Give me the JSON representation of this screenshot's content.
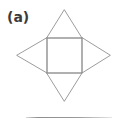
{
  "figure": {
    "part_label": "(a)",
    "caption_rule_visible": true,
    "background_color": "#ffffff",
    "stroke_color": "#8a8a8a",
    "label_color": "#3b3b3b",
    "rule_color": "#9a9a9a",
    "geometry": {
      "viewbox": "0 0 126 123",
      "square": {
        "name": "central-square",
        "x": 47,
        "y": 38,
        "width": 35,
        "height": 35,
        "corners": [
          [
            47,
            38
          ],
          [
            82,
            38
          ],
          [
            82,
            73
          ],
          [
            47,
            73
          ]
        ]
      },
      "triangles": [
        {
          "name": "top-triangle",
          "points": "47,38 82,38 64.5,10",
          "apex": [
            64.5,
            10
          ],
          "base": [
            [
              47,
              38
            ],
            [
              82,
              38
            ]
          ]
        },
        {
          "name": "right-triangle",
          "points": "82,38 82,73 110,55.5",
          "apex": [
            110,
            55.5
          ],
          "base": [
            [
              82,
              38
            ],
            [
              82,
              73
            ]
          ]
        },
        {
          "name": "bottom-triangle",
          "points": "47,73 82,73 64.5,101",
          "apex": [
            64.5,
            101
          ],
          "base": [
            [
              47,
              73
            ],
            [
              82,
              73
            ]
          ]
        },
        {
          "name": "left-triangle",
          "points": "47,38 47,73 17,55.5",
          "apex": [
            17,
            55.5
          ],
          "base": [
            [
              47,
              38
            ],
            [
              47,
              73
            ]
          ]
        }
      ],
      "rule": {
        "x1": 26,
        "y1": 117,
        "x2": 112,
        "y2": 117
      }
    }
  }
}
